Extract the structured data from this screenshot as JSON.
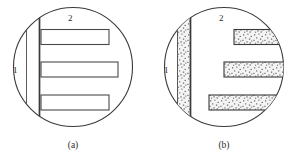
{
  "figure": {
    "panels": [
      {
        "id": "panel-a",
        "caption": "(a)",
        "description": "Unfilled outline version: three open rectangular bars and a vertical double-line band inside a circle",
        "labels": [
          {
            "name": "region-1",
            "text": "1"
          },
          {
            "name": "region-2",
            "text": "2"
          }
        ],
        "fill_style": "open",
        "bar_count": 3,
        "circle": {
          "cx": 73,
          "cy": 67,
          "r": 60
        }
      },
      {
        "id": "panel-b",
        "caption": "(b)",
        "description": "Stipple-filled version: three speckled bars extending past the circle edge and a speckled vertical band",
        "labels": [
          {
            "name": "region-1",
            "text": "1"
          },
          {
            "name": "region-2",
            "text": "2"
          }
        ],
        "fill_style": "stippled",
        "bar_count": 3,
        "circle": {
          "cx": 224,
          "cy": 67,
          "r": 60
        }
      }
    ],
    "colors": {
      "stroke": "#3a3a3a",
      "background": "#ffffff",
      "stipple_base": "#f2f2f2",
      "stipple_dot": "#4a4a4a"
    }
  }
}
